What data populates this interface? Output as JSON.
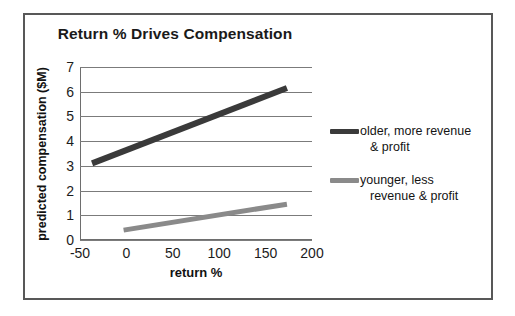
{
  "chart_data": {
    "type": "line",
    "title": "Return % Drives Compensation",
    "xlabel": "return %",
    "ylabel": "predicted compensation ($M)",
    "xlim": [
      -50,
      200
    ],
    "ylim": [
      0,
      7
    ],
    "xticks": [
      "-50",
      "0",
      "50",
      "100",
      "150",
      "200"
    ],
    "xtick_values": [
      -50,
      0,
      50,
      100,
      150,
      200
    ],
    "yticks": [
      "0",
      "1",
      "2",
      "3",
      "4",
      "5",
      "6",
      "7"
    ],
    "ytick_values": [
      0,
      1,
      2,
      3,
      4,
      5,
      6,
      7
    ],
    "grid": "horizontal",
    "legend_position": "right",
    "series": [
      {
        "name": "older, more revenue & profit",
        "legend_line_1": "older, more revenue",
        "legend_line_2": "& profit",
        "color": "#3a3a3a",
        "x": [
          -37,
          173
        ],
        "y": [
          3.1,
          6.15
        ]
      },
      {
        "name": "younger, less revenue & profit",
        "legend_line_1": "younger, less",
        "legend_line_2": "revenue & profit",
        "color": "#8a8a8a",
        "x": [
          -3,
          173
        ],
        "y": [
          0.4,
          1.45
        ]
      }
    ]
  },
  "frame": {
    "border_color": "#585858"
  }
}
